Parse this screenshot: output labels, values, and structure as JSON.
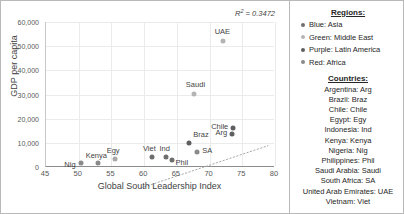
{
  "chart_data": {
    "type": "scatter",
    "title": "",
    "xlabel": "Global South Leadership Index",
    "ylabel": "GDP per capita",
    "xlim": [
      45,
      80
    ],
    "ylim": [
      0,
      60000
    ],
    "xticks": [
      45,
      50,
      55,
      60,
      65,
      70,
      75,
      80
    ],
    "yticks": [
      0,
      10000,
      20000,
      30000,
      40000,
      50000,
      60000
    ],
    "ytick_labels": [
      "0",
      "10,000",
      "20,000",
      "30,000",
      "40,000",
      "50,000",
      "60,000"
    ],
    "grid": true,
    "legend_position": "right-panel",
    "annotation": "R² = 0.3472",
    "annotation_value": 0.3472,
    "trendline": {
      "type": "linear-dotted",
      "x_start": 52.8,
      "y_start": 0,
      "x_end": 72.2,
      "y_end": 17500
    },
    "points": [
      {
        "label": "Nig",
        "country": "Nigeria",
        "region": "Africa",
        "x": 50.4,
        "y": 1500,
        "color": "#8a8a8a",
        "label_dx": -17,
        "label_dy": 2
      },
      {
        "label": "Kenya",
        "country": "Kenya",
        "region": "Africa",
        "x": 52.9,
        "y": 1800,
        "color": "#8a8a8a",
        "label_dx": -12,
        "label_dy": -7
      },
      {
        "label": "Egy",
        "country": "Egypt",
        "region": "Africa",
        "x": 55.5,
        "y": 3400,
        "color": "#a8a8a8",
        "label_dx": -8,
        "label_dy": -8
      },
      {
        "label": "Viet",
        "country": "Vietnam",
        "region": "Asia",
        "x": 61.2,
        "y": 4200,
        "color": "#6e6e6e",
        "label_dx": -9,
        "label_dy": -8
      },
      {
        "label": "Ind",
        "country": "Indonesia",
        "region": "Asia",
        "x": 63.4,
        "y": 4300,
        "color": "#6e6e6e",
        "label_dx": -7,
        "label_dy": -8
      },
      {
        "label": "Phil",
        "country": "Philippines",
        "region": "Asia",
        "x": 64.2,
        "y": 2900,
        "color": "#6e6e6e",
        "label_dx": 4,
        "label_dy": 3
      },
      {
        "label": "Braz",
        "country": "Brazil",
        "region": "Latin America",
        "x": 66.9,
        "y": 10100,
        "color": "#5f5f5f",
        "label_dx": 4,
        "label_dy": -8
      },
      {
        "label": "SA",
        "country": "South Africa",
        "region": "Africa",
        "x": 68.1,
        "y": 6300,
        "color": "#8a8a8a",
        "label_dx": 5,
        "label_dy": -1
      },
      {
        "label": "Saudi",
        "country": "Saudi Arabia",
        "region": "Middle East",
        "x": 67.6,
        "y": 30200,
        "color": "#b4b4b4",
        "label_dx": -8,
        "label_dy": -9
      },
      {
        "label": "UAE",
        "country": "United Arab Emirates",
        "region": "Middle East",
        "x": 72.0,
        "y": 52300,
        "color": "#b4b4b4",
        "label_dx": -8,
        "label_dy": -9
      },
      {
        "label": "Chile",
        "country": "Chile",
        "region": "Latin America",
        "x": 73.6,
        "y": 16200,
        "color": "#5f5f5f",
        "label_dx": -22,
        "label_dy": -1
      },
      {
        "label": "Arg",
        "country": "Argentina",
        "region": "Latin America",
        "x": 73.5,
        "y": 13600,
        "color": "#5f5f5f",
        "label_dx": -17,
        "label_dy": -1
      }
    ]
  },
  "legend": {
    "regions_heading": "Regions:",
    "regions": [
      {
        "label": "Blue: Asia",
        "color": "#6e6e6e"
      },
      {
        "label": "Green: Middle East",
        "color": "#b4b4b4"
      },
      {
        "label": "Purple: Latin America",
        "color": "#5f5f5f"
      },
      {
        "label": "Red: Africa",
        "color": "#8a8a8a"
      }
    ],
    "countries_heading": "Countries:",
    "countries": [
      "Argentina: Arg",
      "Brazil: Braz",
      "Chile: Chile",
      "Egypt: Egy",
      "Indonesia: Ind",
      "Kenya: Kenya",
      "Nigeria: Nig",
      "Philippines: Phil",
      "Saudi Arabia: Saudi",
      "South Africa: SA",
      "United Arab Emirates: UAE",
      "Vietnam: Viet"
    ]
  }
}
